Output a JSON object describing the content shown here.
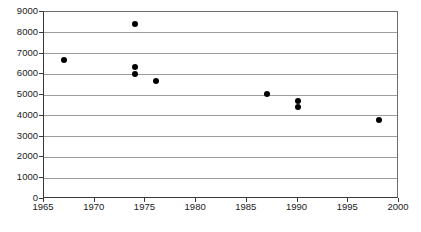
{
  "chart_data": {
    "type": "scatter",
    "title": "",
    "subtitle": "",
    "xlabel": "",
    "ylabel": "",
    "xlim": [
      1965,
      2000
    ],
    "ylim": [
      0,
      9000
    ],
    "grid": true,
    "legend": null,
    "legend_position": "none",
    "xticks": [
      1965,
      1970,
      1975,
      1980,
      1985,
      1990,
      1995,
      2000
    ],
    "yticks": [
      0,
      1000,
      2000,
      3000,
      4000,
      5000,
      6000,
      7000,
      8000,
      9000
    ],
    "xtick_labels": [
      "1965",
      "1970",
      "1975",
      "1980",
      "1985",
      "1990",
      "1995",
      "2000"
    ],
    "ytick_labels": [
      "0",
      "1000",
      "2000",
      "3000",
      "4000",
      "5000",
      "6000",
      "7000",
      "8000",
      "9000"
    ],
    "marker": "filled-circle",
    "marker_color": "#000000",
    "grid_color": "#9c9c9c",
    "axis_color": "#3a3a3a",
    "background": "#ffffff",
    "points": [
      {
        "x": 1967,
        "y": 6700
      },
      {
        "x": 1974,
        "y": 8400
      },
      {
        "x": 1974,
        "y": 6350
      },
      {
        "x": 1974,
        "y": 6000
      },
      {
        "x": 1976,
        "y": 5670
      },
      {
        "x": 1987,
        "y": 5050
      },
      {
        "x": 1990,
        "y": 4700
      },
      {
        "x": 1990,
        "y": 4430
      },
      {
        "x": 1998,
        "y": 3800
      }
    ]
  },
  "caption": {
    "text": ""
  }
}
